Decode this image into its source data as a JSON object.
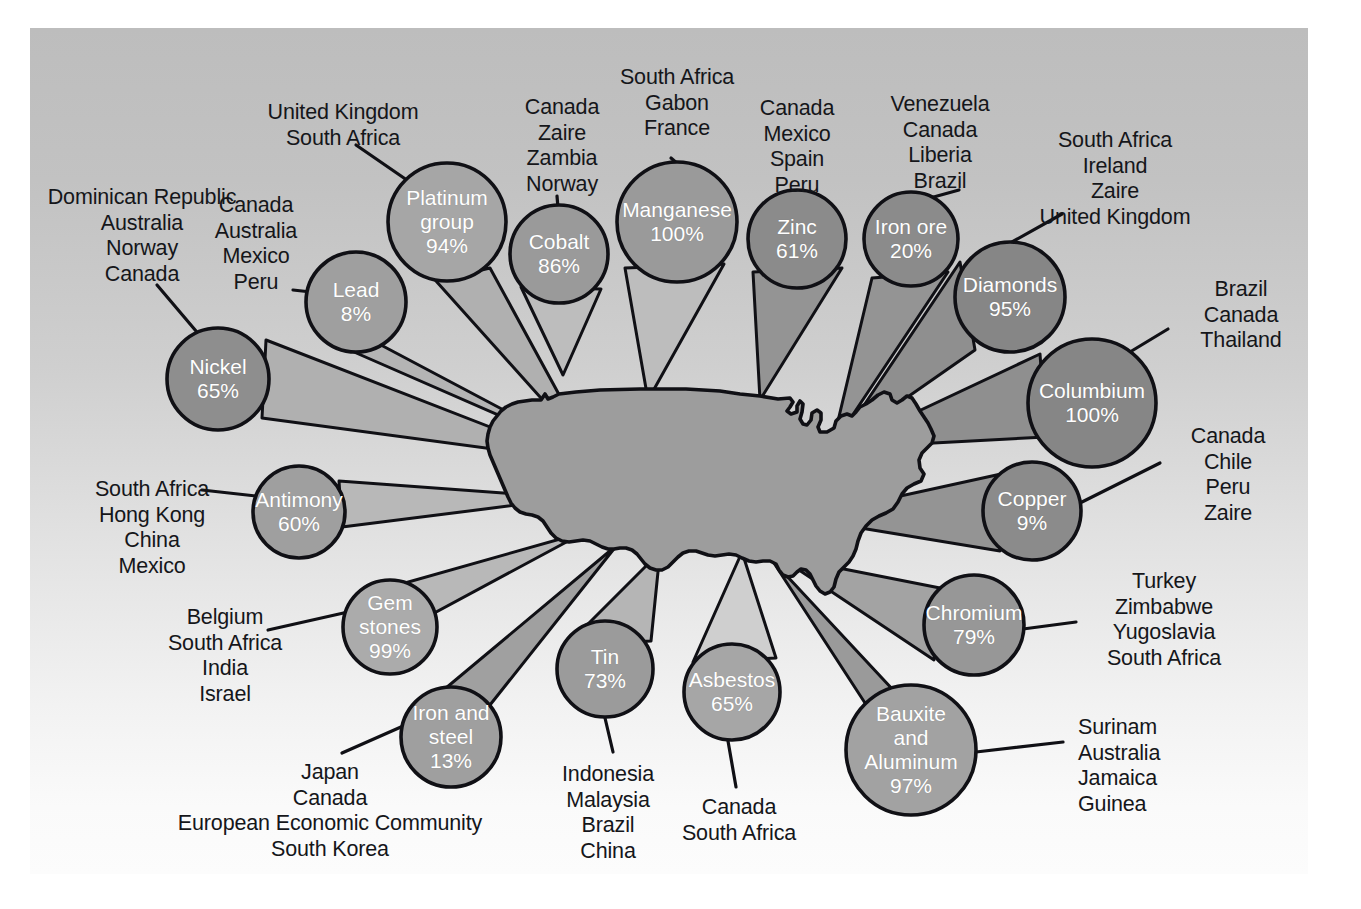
{
  "figure": {
    "center_shape": "united-states-map"
  },
  "palette": {
    "plate_top": "#bdbdbd",
    "plate_bottom": "#fcfcfc",
    "bubble_dark": "#8e8e8e",
    "bubble_mid": "#9a9a9a",
    "bubble_light": "#a9a9a9",
    "wedge_dark": "#939393",
    "wedge_light": "#b4b4b4",
    "map_fill": "#9d9d9d",
    "stroke": "#101015",
    "label_text": "#15161a",
    "bubble_text": "#ffffff"
  },
  "minerals": [
    {
      "id": "platinum-group",
      "name": "Platinum\ngroup",
      "percent": "94%",
      "sources": "United Kingdom\nSouth Africa",
      "cx": 447,
      "cy": 222,
      "r": 59,
      "label_x": 253,
      "label_y": 100,
      "label_align": "c",
      "label_w": 180
    },
    {
      "id": "lead",
      "name": "Lead",
      "percent": "8%",
      "sources": "Canada\nAustralia\nMexico\nPeru",
      "cx": 356,
      "cy": 302,
      "r": 50,
      "label_x": 200,
      "label_y": 193,
      "label_align": "c",
      "label_w": 112
    },
    {
      "id": "nickel",
      "name": "Nickel",
      "percent": "65%",
      "sources": "Dominican Republic\nAustralia\nNorway\nCanada",
      "cx": 218,
      "cy": 379,
      "r": 51,
      "label_x": 36,
      "label_y": 185,
      "label_align": "c",
      "label_w": 212
    },
    {
      "id": "antimony",
      "name": "Antimony",
      "percent": "60%",
      "sources": "South Africa\nHong Kong\nChina\nMexico",
      "cx": 299,
      "cy": 512,
      "r": 46,
      "label_x": 66,
      "label_y": 477,
      "label_align": "c",
      "label_w": 172
    },
    {
      "id": "gem-stones",
      "name": "Gem\nstones",
      "percent": "99%",
      "sources": "Belgium\nSouth Africa\nIndia\nIsrael",
      "cx": 390,
      "cy": 627,
      "r": 47,
      "label_x": 141,
      "label_y": 605,
      "label_align": "c",
      "label_w": 168
    },
    {
      "id": "iron-and-steel",
      "name": "Iron and\nsteel",
      "percent": "13%",
      "sources": "Japan\nCanada\nEuropean Economic Community\nSouth Korea",
      "cx": 451,
      "cy": 737,
      "r": 50,
      "label_x": 160,
      "label_y": 760,
      "label_align": "c",
      "label_w": 340
    },
    {
      "id": "tin",
      "name": "Tin",
      "percent": "73%",
      "sources": "Indonesia\nMalaysia\nBrazil\nChina",
      "cx": 605,
      "cy": 669,
      "r": 48,
      "label_x": 541,
      "label_y": 762,
      "label_align": "c",
      "label_w": 134
    },
    {
      "id": "asbestos",
      "name": "Asbestos",
      "percent": "65%",
      "sources": "Canada\nSouth Africa",
      "cx": 732,
      "cy": 692,
      "r": 48,
      "label_x": 660,
      "label_y": 795,
      "label_align": "c",
      "label_w": 158
    },
    {
      "id": "bauxite-and-aluminum",
      "name": "Bauxite\nand\nAluminum",
      "percent": "97%",
      "sources": "Surinam\nAustralia\nJamaica\nGuinea",
      "cx": 911,
      "cy": 750,
      "r": 65,
      "label_x": 1078,
      "label_y": 715,
      "label_align": "l",
      "label_w": 160
    },
    {
      "id": "chromium",
      "name": "Chromium",
      "percent": "79%",
      "sources": "Turkey\nZimbabwe\nYugoslavia\nSouth Africa",
      "cx": 974,
      "cy": 625,
      "r": 50,
      "label_x": 1083,
      "label_y": 569,
      "label_align": "c",
      "label_w": 162
    },
    {
      "id": "copper",
      "name": "Copper",
      "percent": "9%",
      "sources": "Canada\nChile\nPeru\nZaire",
      "cx": 1032,
      "cy": 511,
      "r": 49,
      "label_x": 1172,
      "label_y": 424,
      "label_align": "c",
      "label_w": 112
    },
    {
      "id": "columbium",
      "name": "Columbium",
      "percent": "100%",
      "sources": "Brazil\nCanada\nThailand",
      "cx": 1092,
      "cy": 403,
      "r": 64,
      "label_x": 1175,
      "label_y": 277,
      "label_align": "c",
      "label_w": 132
    },
    {
      "id": "diamonds",
      "name": "Diamonds",
      "percent": "95%",
      "sources": "South Africa\nIreland\nZaire\nUnited Kingdom",
      "cx": 1010,
      "cy": 297,
      "r": 55,
      "label_x": 1004,
      "label_y": 128,
      "label_align": "c",
      "label_w": 222
    },
    {
      "id": "iron-ore",
      "name": "Iron ore",
      "percent": "20%",
      "sources": "Venezuela\nCanada\nLiberia\nBrazil",
      "cx": 911,
      "cy": 239,
      "r": 47,
      "label_x": 860,
      "label_y": 92,
      "label_align": "c",
      "label_w": 160
    },
    {
      "id": "zinc",
      "name": "Zinc",
      "percent": "61%",
      "sources": "Canada\nMexico\nSpain\nPeru",
      "cx": 797,
      "cy": 239,
      "r": 49,
      "label_x": 741,
      "label_y": 96,
      "label_align": "c",
      "label_w": 112
    },
    {
      "id": "manganese",
      "name": "Manganese",
      "percent": "100%",
      "sources": "South Africa\nGabon\nFrance",
      "cx": 677,
      "cy": 222,
      "r": 60,
      "label_x": 591,
      "label_y": 65,
      "label_align": "c",
      "label_w": 172
    },
    {
      "id": "cobalt",
      "name": "Cobalt",
      "percent": "86%",
      "sources": "Canada\nZaire\nZambia\nNorway",
      "cx": 559,
      "cy": 254,
      "r": 49,
      "label_x": 506,
      "label_y": 95,
      "label_align": "c",
      "label_w": 112
    }
  ]
}
